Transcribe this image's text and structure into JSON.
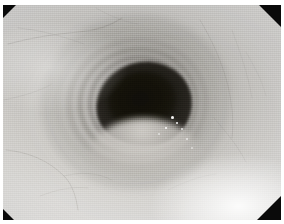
{
  "image": {
    "kind": "endoscopy-photograph",
    "modality": "white-light endoscopy",
    "color_mode": "grayscale",
    "width_px": 284,
    "height_px": 224,
    "subject": "esophageal lumen with concentric mucosal rings",
    "view": "axial down-the-barrel lumen view",
    "caption": "Endoscopic view of the esophageal lumen showing concentric circumferential mucosal rings converging on a dark central lumen."
  },
  "scene": {
    "lumen": {
      "label": "central lumen",
      "center_x_pct": 51,
      "center_y_pct": 47,
      "width_pct": 34,
      "height_pct": 38,
      "darkest_hex": "#100e0a"
    },
    "rings": {
      "label": "concentric mucosal folds",
      "count": 9,
      "description": "stacked circumferential ridges receding into the lumen"
    },
    "fold_lip": {
      "label": "lower mucosal fold",
      "description": "pale fold bulging upward across the inferior lumen margin"
    },
    "highlights": {
      "label": "specular reflections",
      "count": 7,
      "description": "bright mucus flecks inferolateral to the lumen"
    },
    "vessels": {
      "label": "submucosal vascular pattern",
      "description": "faint branching vessels over the pale mucosa"
    }
  },
  "optics": {
    "frame_border_hex": "#ffffff",
    "corner_mask_hex": "#0a0a0a",
    "corner_masks": [
      {
        "position": "top-left",
        "size_px": 13
      },
      {
        "position": "top-right",
        "size_px": 22
      },
      {
        "position": "bottom-left",
        "size_px": 11
      },
      {
        "position": "bottom-right",
        "size_px": 24
      }
    ]
  },
  "palette": {
    "mucosa_light_hex": "#e4e2de",
    "mucosa_mid_hex": "#cdcbc7",
    "mucosa_shadow_hex": "#9a9894",
    "ring_shadow_hex": "#3a3632",
    "lumen_dark_hex": "#17150f",
    "specular_hex": "#ffffff"
  }
}
